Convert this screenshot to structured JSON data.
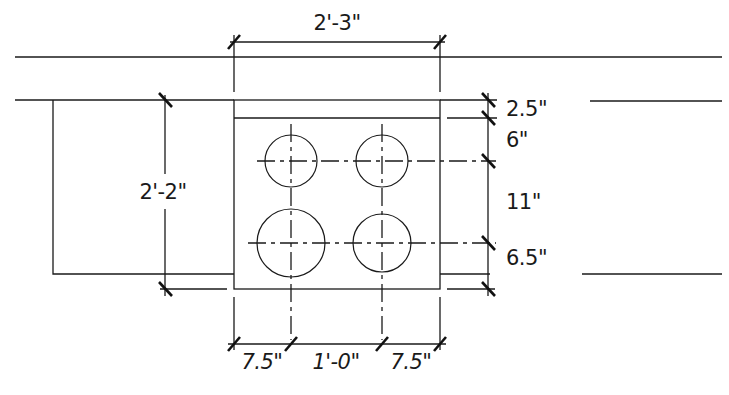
{
  "drawing": {
    "type": "plan-detail",
    "colors": {
      "line": "#1a1a1a",
      "background": "#ffffff"
    },
    "dimensions": {
      "overall_width": "2'-3\"",
      "overall_height": "2'-2\"",
      "right_top": "2.5\"",
      "right_upper": "6\"",
      "right_middle": "11\"",
      "right_lower": "6.5\"",
      "bottom_left": "7.5\"",
      "bottom_middle": "1'-0\"",
      "bottom_right": "7.5\""
    },
    "holes": [
      {
        "id": "top-left",
        "cx": 291,
        "cy": 161,
        "r": 26
      },
      {
        "id": "top-right",
        "cx": 382,
        "cy": 161,
        "r": 26
      },
      {
        "id": "bottom-left",
        "cx": 291,
        "cy": 243,
        "r": 34
      },
      {
        "id": "bottom-right",
        "cx": 382,
        "cy": 243,
        "r": 29
      }
    ]
  }
}
